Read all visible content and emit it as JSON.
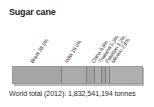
{
  "chart": {
    "title": "Sugar cane",
    "footer": "World total (2012): 1,832,541,194 tonnes"
  },
  "chart_data": {
    "type": "bar",
    "subtype": "stacked-single-bar",
    "orientation": "horizontal",
    "title": "Sugar cane",
    "xlabel": "",
    "ylabel": "",
    "unit": "percent of world total",
    "grid": false,
    "legend": "none",
    "annotation": "World total (2012): 1,832,541,194 tonnes",
    "world_total_year": "2012",
    "world_total_value": "1,832,541,194 tonnes",
    "categories": [
      "Brazil",
      "India",
      "China",
      "Thailand",
      "Pakistan",
      "Mexico",
      "Other"
    ],
    "values": [
      38.3,
      19.0,
      6.6,
      5.3,
      3.2,
      2.8,
      24.8
    ],
    "labels": [
      "Brazil 38.3%",
      "India 19.0%",
      "China 6.6%",
      "Thailand 5.3%",
      "Pakistan 3.2%",
      "Mexico 2.8%"
    ],
    "colors": {
      "bar_fill": "#a8a8a8",
      "bar_border": "#9a9a9a",
      "segment_divider": "#7f7f7f",
      "shadow": "#b9b9b9",
      "text": "#2b2b2b",
      "background": "#ffffff"
    },
    "segments": [
      {
        "name": "Brazil",
        "label": "Brazil 38.3%",
        "value": 38.3,
        "fill": "#a5a5a5",
        "label_left": 34
      },
      {
        "name": "India",
        "label": "India 19.0%",
        "value": 19.0,
        "fill": "#ababab",
        "label_left": 68
      },
      {
        "name": "China",
        "label": "China 6.6%",
        "value": 6.6,
        "fill": "#a3a3a3",
        "label_left": 95
      },
      {
        "name": "Thailand",
        "label": "Thailand 5.3%",
        "value": 5.3,
        "fill": "#adadad",
        "label_left": 102
      },
      {
        "name": "Pakistan",
        "label": "Pakistan 3.2%",
        "value": 3.2,
        "fill": "#a0a0a0",
        "label_left": 109
      },
      {
        "name": "Mexico",
        "label": "Mexico 2.8%",
        "value": 2.8,
        "fill": "#aaaaaa",
        "label_left": 115
      },
      {
        "name": "Other",
        "label": "",
        "value": 24.8,
        "fill": "#b0b0b0",
        "label_left": 0
      }
    ]
  }
}
